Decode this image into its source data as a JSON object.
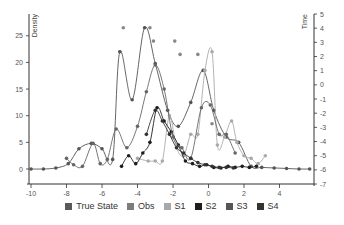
{
  "chart_data": {
    "type": "line",
    "title": "",
    "xlabel": "",
    "ylabel_left": "Density",
    "ylabel_right": "Time",
    "xlim": [
      -10.2,
      5.9
    ],
    "ylim_left": [
      -3,
      29
    ],
    "ylim_right": [
      -7,
      5
    ],
    "x_ticks": [
      -10,
      -8,
      -6,
      -4,
      -2,
      0,
      2,
      4
    ],
    "y_left_ticks": [
      0,
      5,
      10,
      15,
      20,
      25
    ],
    "y_right_ticks": [
      5,
      4,
      3,
      2,
      1,
      0,
      -1,
      -2,
      -3,
      -4,
      -5,
      -6,
      -7
    ],
    "grid": false,
    "legend_position": "bottom",
    "series": [
      {
        "name": "True State",
        "color": "#555555",
        "style": "line-markers",
        "x": [
          -10,
          -9.3,
          -8.6,
          -7.9,
          -7.3,
          -6.6,
          -6.0,
          -5.4,
          -5.0,
          -4.3,
          -3.6,
          -3.0,
          -2.3,
          -1.7,
          -1.0,
          -0.3,
          0.3,
          1.0,
          1.7,
          2.4,
          3.0,
          3.7,
          4.4,
          5.1,
          5.7
        ],
        "y": [
          0,
          0,
          0.2,
          1.0,
          3.8,
          4.8,
          3.8,
          1.8,
          22.0,
          13.0,
          26.5,
          19.8,
          11.0,
          8.0,
          12.5,
          18.5,
          11.0,
          6.0,
          5.0,
          0.5,
          0.3,
          0.2,
          0.1,
          0,
          0
        ]
      },
      {
        "name": "Obs",
        "color": "#888888",
        "style": "markers",
        "x": [
          -4.8,
          -3.3,
          -3.1,
          -1.9,
          -1.6,
          -0.6,
          0.2
        ],
        "y": [
          26.5,
          26.5,
          24.0,
          24.0,
          21.5,
          21.5,
          8.5
        ]
      },
      {
        "name": "S1",
        "color": "#aaaaaa",
        "style": "line-markers",
        "x": [
          -4.0,
          -3.4,
          -3.0,
          -2.6,
          -2.2,
          -1.8,
          -1.4,
          -1.0,
          -0.6,
          -0.2,
          0.2,
          0.5,
          0.9,
          1.3,
          1.6,
          2.0,
          2.4,
          2.8,
          3.2
        ],
        "y": [
          2.0,
          1.5,
          1.5,
          1.5,
          10.0,
          4.0,
          2.5,
          6.5,
          6.5,
          18.5,
          22.0,
          4.5,
          6.0,
          9.0,
          5.0,
          2.5,
          2.0,
          1.0,
          2.5
        ]
      },
      {
        "name": "S2",
        "color": "#1e1e1e",
        "style": "line-markers",
        "x": [
          -4.9,
          -4.5,
          -4.1,
          -3.7,
          -3.3,
          -2.9,
          -2.5,
          -2.1,
          -1.7,
          -1.3,
          -0.9,
          -0.5,
          -0.1,
          0.3,
          0.7,
          1.1,
          1.5,
          1.9,
          2.3,
          2.7
        ],
        "y": [
          0.5,
          2.5,
          1.0,
          3.0,
          5.0,
          11.5,
          9.0,
          7.0,
          4.5,
          1.5,
          1.0,
          0.5,
          0.8,
          0.3,
          0.2,
          0.5,
          0.3,
          0.5,
          0.3,
          0.5
        ]
      },
      {
        "name": "S3",
        "color": "#666666",
        "style": "line-markers",
        "x": [
          -8.0,
          -7.6,
          -7.1,
          -6.5,
          -6.1,
          -5.7,
          -5.2,
          -4.6,
          -4.0,
          -3.5,
          -3.0,
          -2.5,
          -2.0,
          -1.5,
          -1.0,
          -0.4,
          0.1,
          0.6,
          1.0,
          1.5
        ],
        "y": [
          2.0,
          0.8,
          0.5,
          4.8,
          1.0,
          1.8,
          7.5,
          4.0,
          8.0,
          14.5,
          19.5,
          15.0,
          6.0,
          4.0,
          2.0,
          11.5,
          12.0,
          6.5,
          6.5,
          3.0
        ]
      },
      {
        "name": "S4",
        "color": "#333333",
        "style": "line-markers",
        "x": [
          -3.5,
          -3.0,
          -2.6,
          -2.2,
          -1.8,
          -1.4,
          -1.0,
          -0.6,
          -0.2,
          0.2,
          0.6,
          1.0,
          1.4
        ],
        "y": [
          6.5,
          11.0,
          9.0,
          6.5,
          4.0,
          3.0,
          2.0,
          1.2,
          0.8,
          0.5,
          0.3,
          0.3,
          0.2
        ]
      }
    ]
  },
  "legend": {
    "items": [
      {
        "label": "True State",
        "color": "#5a5a5a"
      },
      {
        "label": "Obs",
        "color": "#7c7c7c"
      },
      {
        "label": "S1",
        "color": "#a8a8a8"
      },
      {
        "label": "S2",
        "color": "#1e1e1e"
      },
      {
        "label": "S3",
        "color": "#555555"
      },
      {
        "label": "S4",
        "color": "#333333"
      }
    ]
  }
}
